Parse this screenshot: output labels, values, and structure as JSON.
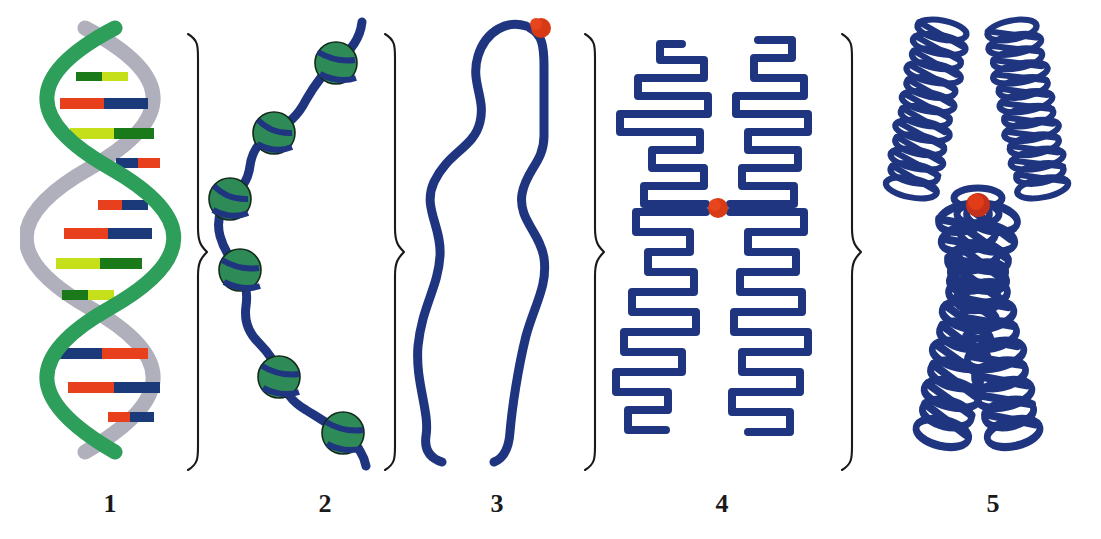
{
  "figure": {
    "background_color": "#ffffff",
    "width": 1101,
    "height": 539
  },
  "palette": {
    "helix_strand_green": "#2e9e5b",
    "helix_strand_gray": "#b0b0bc",
    "base_red": "#e8401c",
    "base_navy": "#1a3a7a",
    "base_yellow_green": "#c5e01a",
    "base_dark_green": "#1a7a1a",
    "chromatin_blue": "#1f357f",
    "histone_green": "#2e8b57",
    "centromere_red": "#d93a16",
    "brace_black": "#1a1a1a",
    "label_black": "#1a1a1a"
  },
  "panels": [
    {
      "number": "1",
      "name": "dna-double-helix",
      "stage_name": "DNA double helix",
      "icon": "double-helix-icon",
      "label_x": 110,
      "elements": {
        "strands": 2,
        "strand_colors": [
          "#2e9e5b",
          "#b0b0bc"
        ],
        "base_pair_colors": [
          [
            "#e8401c",
            "#1a3a7a"
          ],
          [
            "#c5e01a",
            "#1a7a1a"
          ]
        ],
        "base_pair_count": 11,
        "turns": 3
      }
    },
    {
      "number": "2",
      "name": "nucleosome-beads-on-a-string",
      "stage_name": "Nucleosomes (beads on a string)",
      "icon": "beads-on-string-icon",
      "label_x": 325,
      "elements": {
        "bead_count": 6,
        "bead_color": "#2e8b57",
        "linker_color": "#1f357f",
        "bead_radius": 21
      }
    },
    {
      "number": "3",
      "name": "chromatin-fiber-loop",
      "stage_name": "Chromatin fiber loop",
      "icon": "chromatin-loop-icon",
      "label_x": 497,
      "elements": {
        "fiber_color": "#1f357f",
        "fiber_width": 9,
        "centromere_color": "#d93a16",
        "centromere_count": 1
      }
    },
    {
      "number": "4",
      "name": "condensing-sister-chromatids",
      "stage_name": "Condensing sister chromatids",
      "icon": "folded-chromatid-icon",
      "label_x": 722,
      "elements": {
        "arm_count": 2,
        "fiber_color": "#1f357f",
        "fiber_width": 8,
        "centromere_color": "#d93a16",
        "centromere_count": 1
      }
    },
    {
      "number": "5",
      "name": "metaphase-chromosome",
      "stage_name": "Condensed metaphase chromosome",
      "icon": "x-chromosome-icon",
      "label_x": 993,
      "elements": {
        "shape": "X",
        "coil_color": "#1f357f",
        "centromere_color": "#d93a16",
        "centromere_count": 1,
        "arm_count": 4
      }
    }
  ],
  "braces": [
    {
      "name": "brace-1-2",
      "x": 184,
      "glyph": "}"
    },
    {
      "name": "brace-2-3",
      "x": 381,
      "glyph": "}"
    },
    {
      "name": "brace-3-4",
      "x": 581,
      "glyph": "}"
    },
    {
      "name": "brace-4-5",
      "x": 838,
      "glyph": "}"
    }
  ]
}
